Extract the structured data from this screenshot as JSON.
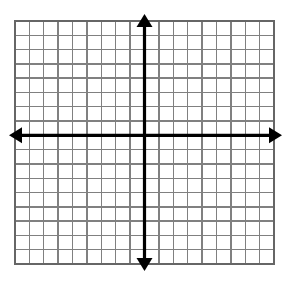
{
  "figure": {
    "type": "coordinate-grid",
    "background_color": "#ffffff",
    "grid_line_color": "#808080",
    "grid_border_color": "#666666",
    "axis_color": "#000000",
    "grid_line_width": 1.4,
    "border_line_width": 2,
    "axis_line_width": 3.2
  },
  "chart_data": {
    "type": "scatter",
    "title": "",
    "subtitle": "",
    "xlabel": "",
    "ylabel": "",
    "grid": true,
    "legend": null,
    "legend_position": "none",
    "annotations": [],
    "series": [],
    "x": [],
    "values": [],
    "xlim": [
      -9,
      9
    ],
    "ylim": [
      -8,
      9
    ],
    "x_tick_labels": [],
    "y_tick_labels": [],
    "tick_step": 1,
    "columns": 18,
    "rows": 17,
    "origin_column_index": 9,
    "origin_row_index": 8,
    "axes": {
      "x_axis": {
        "label": "",
        "arrow_start": true,
        "arrow_end": true,
        "orientation": "horizontal"
      },
      "y_axis": {
        "label": "",
        "arrow_start": true,
        "arrow_end": true,
        "orientation": "vertical"
      }
    }
  },
  "geometry": {
    "grid_left": 15,
    "grid_top": 21,
    "grid_right": 274,
    "grid_bottom": 264,
    "cell_width": 14.39,
    "cell_height": 14.29,
    "origin_x": 144.5,
    "origin_y": 135.3,
    "x_axis_arrow_left_tip": 9,
    "x_axis_arrow_right_tip": 282,
    "y_axis_arrow_top_tip": 14,
    "y_axis_arrow_bottom_tip": 271,
    "arrow_head_length": 13,
    "arrow_head_half_width": 8
  }
}
